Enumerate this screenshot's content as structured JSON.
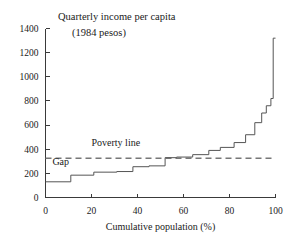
{
  "chart_data": {
    "type": "line",
    "title": "Quarterly income per capita",
    "subtitle": "(1984 pesos)",
    "xlabel": "Cumulative population (%)",
    "ylabel": "",
    "xlim": [
      0,
      100
    ],
    "ylim": [
      0,
      1400
    ],
    "grid": false,
    "legend": "none",
    "xticks": [
      0,
      20,
      40,
      60,
      80,
      100
    ],
    "xtick_labels": [
      "0",
      "20",
      "40",
      "60",
      "80",
      "100"
    ],
    "yticks": [
      0,
      200,
      400,
      600,
      800,
      1000,
      1200,
      1400
    ],
    "ytick_labels": [
      "0",
      "200",
      "400",
      "600",
      "800",
      "1000",
      "1200",
      "1400"
    ],
    "series": [
      {
        "name": "Quarterly income per capita",
        "style": "step",
        "x": [
          0,
          11,
          11,
          21,
          21,
          31,
          31,
          38,
          38,
          45,
          45,
          52,
          52,
          57,
          57,
          64,
          64,
          71,
          71,
          76,
          76,
          82,
          82,
          87,
          87,
          91,
          91,
          94,
          94,
          96,
          96,
          98,
          98,
          99,
          99,
          100
        ],
        "y": [
          130,
          130,
          185,
          185,
          210,
          210,
          215,
          215,
          255,
          255,
          262,
          262,
          330,
          330,
          335,
          335,
          355,
          355,
          390,
          390,
          415,
          415,
          455,
          455,
          520,
          520,
          620,
          620,
          700,
          700,
          760,
          760,
          820,
          820,
          1320,
          1320
        ]
      }
    ],
    "reference_lines": [
      {
        "name": "poverty-line",
        "orientation": "horizontal",
        "value": 325,
        "style": "dashed",
        "label": "Poverty line"
      }
    ],
    "annotations": [
      {
        "name": "poverty-line-label",
        "text": "Poverty line",
        "x": 20,
        "y": 430
      },
      {
        "name": "gap-label",
        "text": "Gap",
        "x": 3,
        "y": 270
      }
    ],
    "colors": {
      "axis": "#3a3a3a",
      "step_line": "#555555",
      "poverty_line": "#777777",
      "text": "#1a1a1a",
      "background": "#ffffff"
    }
  }
}
